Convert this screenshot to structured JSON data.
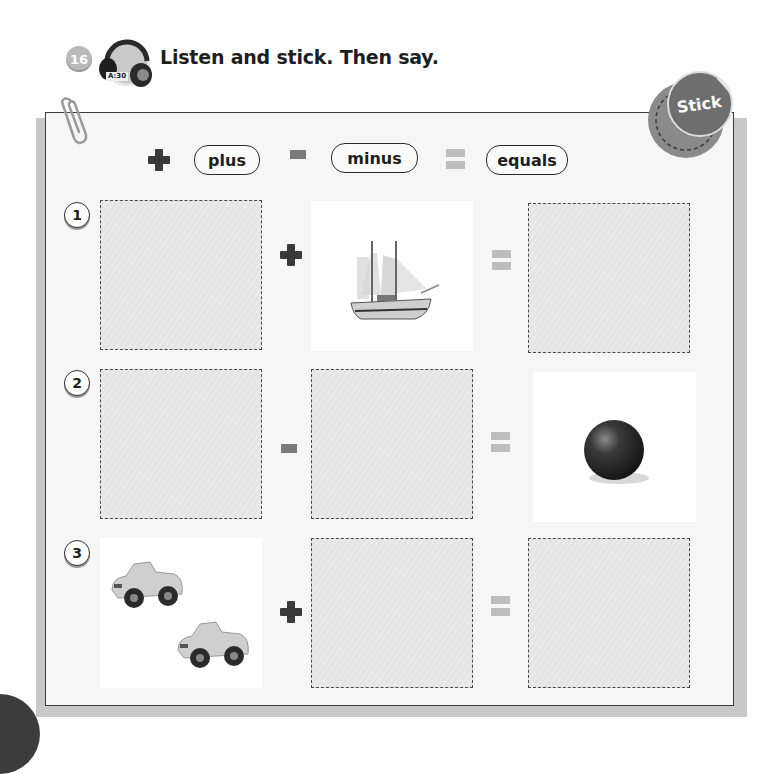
{
  "header": {
    "activity_number": "16",
    "track_label": "A:30",
    "instruction": "Listen and stick. Then say.",
    "headphones_icon": "headphones-icon"
  },
  "badge": {
    "label": "Stick"
  },
  "legend": [
    {
      "symbol": "plus",
      "label": "plus"
    },
    {
      "symbol": "minus",
      "label": "minus"
    },
    {
      "symbol": "equals",
      "label": "equals"
    }
  ],
  "rows": [
    {
      "number": "1",
      "cells": [
        {
          "type": "sticker-slot"
        },
        {
          "type": "picture",
          "content": "sailing ship"
        },
        {
          "type": "sticker-slot"
        }
      ],
      "operator": "plus"
    },
    {
      "number": "2",
      "cells": [
        {
          "type": "sticker-slot"
        },
        {
          "type": "sticker-slot"
        },
        {
          "type": "picture",
          "content": "ball"
        }
      ],
      "operator": "minus"
    },
    {
      "number": "3",
      "cells": [
        {
          "type": "picture",
          "content": "two toy cars"
        },
        {
          "type": "sticker-slot"
        },
        {
          "type": "sticker-slot"
        }
      ],
      "operator": "plus"
    }
  ],
  "colors": {
    "panel_border": "#3c3c3c",
    "slot_fill": "#e5e5e5",
    "plus": "#3a3a3a",
    "minus": "#7a7a7a",
    "equals": "#bdbdbd",
    "badge": "#6e6e6e"
  }
}
